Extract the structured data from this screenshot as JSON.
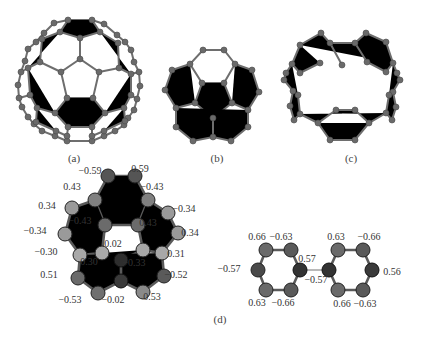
{
  "figure": {
    "panels": [
      {
        "id": "a",
        "label": "(a)",
        "x": 74,
        "y": 162
      },
      {
        "id": "b",
        "label": "(b)",
        "x": 217,
        "y": 162
      },
      {
        "id": "c",
        "label": "(c)",
        "x": 351,
        "y": 162
      },
      {
        "id": "d",
        "label": "(d)",
        "x": 220,
        "y": 323
      }
    ],
    "charges_d_left": [
      {
        "text": "−0.59",
        "x": 90,
        "y": 174
      },
      {
        "text": "0.59",
        "x": 140,
        "y": 172
      },
      {
        "text": "0.43",
        "x": 72,
        "y": 190
      },
      {
        "text": "−0.43",
        "x": 152,
        "y": 190
      },
      {
        "text": "0.34",
        "x": 47,
        "y": 209
      },
      {
        "text": "−0.34",
        "x": 184,
        "y": 212
      },
      {
        "text": "−0.43",
        "x": 80,
        "y": 224
      },
      {
        "text": "0.43",
        "x": 148,
        "y": 226
      },
      {
        "text": "−0.34",
        "x": 35,
        "y": 234
      },
      {
        "text": "0.34",
        "x": 190,
        "y": 236
      },
      {
        "text": "0.02",
        "x": 113,
        "y": 247
      },
      {
        "text": "−0.30",
        "x": 46,
        "y": 255
      },
      {
        "text": "0.31",
        "x": 176,
        "y": 257
      },
      {
        "text": "0.30",
        "x": 89,
        "y": 265
      },
      {
        "text": "−0.33",
        "x": 134,
        "y": 266
      },
      {
        "text": "0.51",
        "x": 49,
        "y": 278
      },
      {
        "text": "−0.52",
        "x": 176,
        "y": 278
      },
      {
        "text": "−0.53",
        "x": 70,
        "y": 303
      },
      {
        "text": "−0.02",
        "x": 113,
        "y": 303
      },
      {
        "text": "0.53",
        "x": 152,
        "y": 300
      }
    ],
    "charges_d_right": [
      {
        "text": "0.66",
        "x": 257,
        "y": 240
      },
      {
        "text": "−0.63",
        "x": 281,
        "y": 240
      },
      {
        "text": "−0.57",
        "x": 229,
        "y": 272
      },
      {
        "text": "0.57",
        "x": 307,
        "y": 262
      },
      {
        "text": "−0.57",
        "x": 316,
        "y": 283
      },
      {
        "text": "0.63",
        "x": 336,
        "y": 240
      },
      {
        "text": "−0.66",
        "x": 369,
        "y": 240
      },
      {
        "text": "0.56",
        "x": 392,
        "y": 275
      },
      {
        "text": "0.63",
        "x": 257,
        "y": 306
      },
      {
        "text": "−0.66",
        "x": 283,
        "y": 306
      },
      {
        "text": "0.66",
        "x": 342,
        "y": 307
      },
      {
        "text": "−0.63",
        "x": 365,
        "y": 307
      }
    ]
  }
}
